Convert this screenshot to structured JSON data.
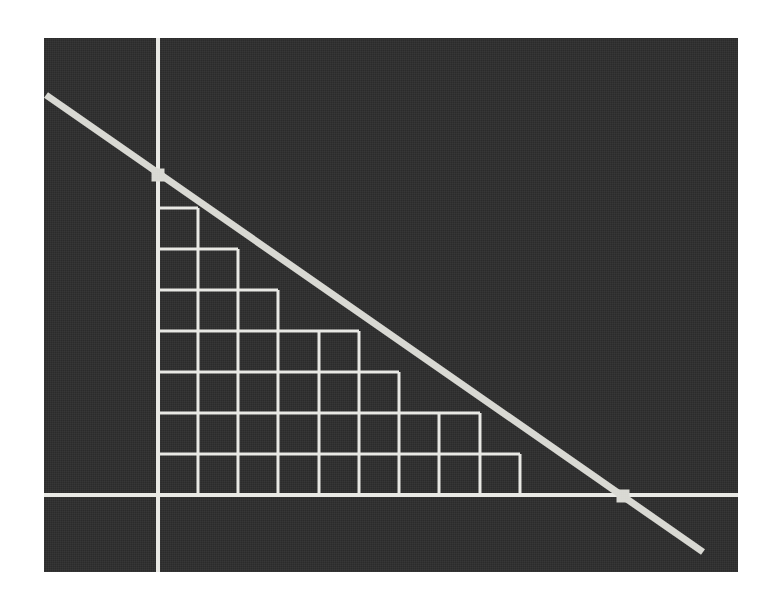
{
  "figure": {
    "title": "",
    "background_color": "#ffffff",
    "panel_color": "#2b2b2b",
    "ink_color": "#e8e8e4",
    "panel": {
      "x": 44,
      "y": 38,
      "width": 694,
      "height": 534
    }
  },
  "chart_data": {
    "type": "line",
    "title": "",
    "subtitle": "",
    "xlabel": "",
    "ylabel": "",
    "grid": true,
    "legend": null,
    "axes": {
      "x_axis_pixel_y": 495,
      "y_axis_pixel_x": 158,
      "x_axis_span_px": [
        44,
        738
      ],
      "y_axis_span_px": [
        38,
        572
      ],
      "axis_color": "#e8e8e4",
      "axis_width_px": 4
    },
    "line": {
      "name": "boundary-line",
      "color": "#d8d8d2",
      "width_px": 7,
      "start_px": [
        46,
        95
      ],
      "end_px": [
        703,
        552
      ],
      "slope_px": -0.6956,
      "x_intercept_px": 623,
      "y_intercept_px": 175
    },
    "markers": [
      {
        "name": "y-axis-intercept-marker",
        "x_px": 158,
        "y_px": 175,
        "size_px": 13,
        "shape": "square",
        "color": "#d8d8d2"
      },
      {
        "name": "x-axis-intercept-marker",
        "x_px": 623,
        "y_px": 496,
        "size_px": 13,
        "shape": "square",
        "color": "#d8d8d2"
      }
    ],
    "grid_block": {
      "origin_px": [
        158,
        495
      ],
      "cell_width_px": 40.3,
      "cell_height_px": 41.0,
      "line_color": "#e8e8e4",
      "line_width_px": 3,
      "rows_top_to_bottom": [
        1,
        2,
        3,
        5,
        6,
        8,
        9,
        11
      ],
      "row_tops_px": [
        208,
        249,
        290,
        331,
        372,
        413,
        454,
        495
      ],
      "column_x_px": [
        158,
        198,
        238,
        278,
        319,
        359,
        399,
        439,
        480,
        520,
        560,
        600
      ],
      "total_cells": 45
    }
  }
}
